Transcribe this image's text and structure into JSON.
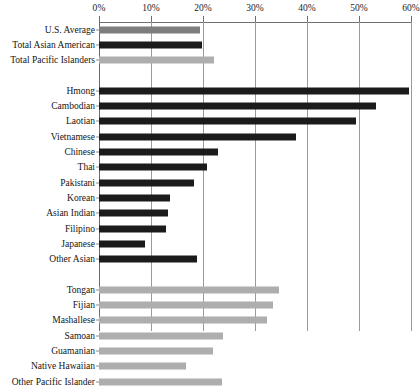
{
  "chart_data": {
    "type": "bar",
    "orientation": "horizontal",
    "title": "",
    "subtitle": "",
    "xlabel": "",
    "ylabel": "",
    "xlim": [
      0,
      60
    ],
    "grid": true,
    "legend": "none",
    "xtick_labels": [
      "0%",
      "10%",
      "20%",
      "30%",
      "40%",
      "50%",
      "60%"
    ],
    "xticks": [
      0,
      10,
      20,
      30,
      40,
      50,
      60
    ],
    "groups": [
      {
        "name": "summary",
        "categories": [
          "U.S. Average",
          "Total Asian American",
          "Total Pacific Islanders"
        ],
        "values": [
          19.4,
          19.9,
          22.1
        ],
        "colors": [
          "#7d7d7d",
          "#1b1b1b",
          "#aeaeae"
        ]
      },
      {
        "name": "asian-subgroups",
        "categories": [
          "Hmong",
          "Cambodian",
          "Laotian",
          "Vietnamese",
          "Chinese",
          "Thai",
          "Pakistani",
          "Korean",
          "Asian Indian",
          "Filipino",
          "Japanese",
          "Other Asian"
        ],
        "values": [
          59.6,
          53.3,
          49.5,
          37.9,
          22.8,
          20.7,
          18.3,
          13.7,
          13.2,
          12.8,
          8.9,
          18.9
        ],
        "color": "#1b1b1b"
      },
      {
        "name": "pacific-islander-subgroups",
        "categories": [
          "Tongan",
          "Fijian",
          "Mashallese",
          "Samoan",
          "Guamanian",
          "Native Hawaiian",
          "Other Pacific Islander"
        ],
        "values": [
          34.7,
          33.5,
          32.3,
          23.9,
          22.0,
          16.8,
          23.7
        ],
        "color": "#aeaeae"
      }
    ],
    "series": [
      {
        "name": "Percent",
        "categories": [
          "U.S. Average",
          "Total Asian American",
          "Total Pacific Islanders",
          "Hmong",
          "Cambodian",
          "Laotian",
          "Vietnamese",
          "Chinese",
          "Thai",
          "Pakistani",
          "Korean",
          "Asian Indian",
          "Filipino",
          "Japanese",
          "Other Asian",
          "Tongan",
          "Fijian",
          "Mashallese",
          "Samoan",
          "Guamanian",
          "Native Hawaiian",
          "Other Pacific Islander"
        ],
        "values": [
          19.4,
          19.9,
          22.1,
          59.6,
          53.3,
          49.5,
          37.9,
          22.8,
          20.7,
          18.3,
          13.7,
          13.2,
          12.8,
          8.9,
          18.9,
          34.7,
          33.5,
          32.3,
          23.9,
          22.0,
          16.8,
          23.7
        ]
      }
    ]
  },
  "colors": {
    "bar_dark": "#1b1b1b",
    "bar_mid": "#7d7d7d",
    "bar_light": "#aeaeae",
    "gridline": "#9a9a9a",
    "axis": "#6f6f6f",
    "text": "#141414",
    "background": "#ffffff"
  }
}
